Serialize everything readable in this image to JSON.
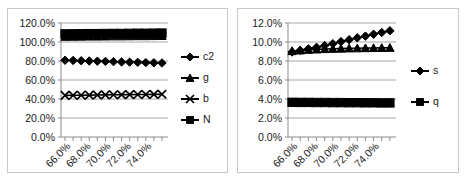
{
  "figure": {
    "panel_count": 2,
    "background_color": "#ffffff",
    "frame_color": "#c8c8c8"
  },
  "chart_data": [
    {
      "id": "left-panel",
      "type": "line",
      "title": "",
      "xlabel": "",
      "ylabel": "",
      "grid": true,
      "legend_position": "right",
      "xlim": [
        65.0,
        75.6
      ],
      "ylim": [
        0.0,
        1.2
      ],
      "ytick_labels": [
        "0.0%",
        "20.0%",
        "40.0%",
        "60.0%",
        "80.0%",
        "100.0%",
        "120.0%"
      ],
      "ytick_values": [
        0.0,
        0.2,
        0.4,
        0.6,
        0.8,
        1.0,
        1.2
      ],
      "xtick_labels": [
        "66.0%",
        "68.0%",
        "70.0%",
        "72.0%",
        "74.0%"
      ],
      "xtick_values": [
        66.0,
        68.0,
        70.0,
        72.0,
        74.0
      ],
      "x": [
        65.4,
        66.2,
        67.0,
        67.8,
        68.6,
        69.4,
        70.2,
        71.0,
        71.8,
        72.6,
        73.4,
        74.2,
        75.0
      ],
      "series": [
        {
          "name": "c2",
          "marker": "diamond",
          "values": [
            0.808,
            0.806,
            0.803,
            0.8,
            0.798,
            0.796,
            0.793,
            0.79,
            0.788,
            0.786,
            0.783,
            0.781,
            0.779
          ]
        },
        {
          "name": "g",
          "marker": "triangle",
          "values": [
            1.055,
            1.056,
            1.057,
            1.058,
            1.058,
            1.059,
            1.06,
            1.06,
            1.061,
            1.062,
            1.062,
            1.063,
            1.064
          ]
        },
        {
          "name": "b",
          "marker": "x",
          "values": [
            0.438,
            0.439,
            0.44,
            0.441,
            0.442,
            0.443,
            0.444,
            0.445,
            0.446,
            0.447,
            0.448,
            0.449,
            0.45
          ]
        },
        {
          "name": "N",
          "marker": "square",
          "values": [
            1.085,
            1.086,
            1.087,
            1.088,
            1.088,
            1.089,
            1.09,
            1.09,
            1.091,
            1.092,
            1.092,
            1.093,
            1.094
          ]
        }
      ],
      "legend": [
        {
          "label": "c2",
          "marker": "diamond"
        },
        {
          "label": "g",
          "marker": "triangle"
        },
        {
          "label": "b",
          "marker": "x"
        },
        {
          "label": "N",
          "marker": "square"
        }
      ]
    },
    {
      "id": "right-panel",
      "type": "line",
      "title": "",
      "xlabel": "",
      "ylabel": "",
      "grid": true,
      "legend_position": "right",
      "xlim": [
        65.0,
        75.6
      ],
      "ylim": [
        0.0,
        0.12
      ],
      "ytick_labels": [
        "0.0%",
        "2.0%",
        "4.0%",
        "6.0%",
        "8.0%",
        "10.0%",
        "12.0%"
      ],
      "ytick_values": [
        0.0,
        0.02,
        0.04,
        0.06,
        0.08,
        0.1,
        0.12
      ],
      "xtick_labels": [
        "66.0%",
        "68.0%",
        "70.0%",
        "72.0%",
        "74.0%"
      ],
      "xtick_values": [
        66.0,
        68.0,
        70.0,
        72.0,
        74.0
      ],
      "x": [
        65.4,
        66.2,
        67.0,
        67.8,
        68.6,
        69.4,
        70.2,
        71.0,
        71.8,
        72.6,
        73.4,
        74.2,
        75.0
      ],
      "series": [
        {
          "name": "s",
          "marker": "diamond",
          "values": [
            0.0895,
            0.0912,
            0.0928,
            0.0944,
            0.0962,
            0.0982,
            0.1004,
            0.1024,
            0.1044,
            0.1062,
            0.1082,
            0.11,
            0.1118
          ]
        },
        {
          "name": "unlabeled-triangle",
          "marker": "triangle",
          "values": [
            0.0905,
            0.0912,
            0.0918,
            0.0922,
            0.0926,
            0.0929,
            0.0931,
            0.0933,
            0.0934,
            0.0936,
            0.0937,
            0.0938,
            0.0939
          ]
        },
        {
          "name": "q",
          "marker": "square",
          "values": [
            0.0365,
            0.0364,
            0.0364,
            0.0363,
            0.0363,
            0.0362,
            0.0362,
            0.0361,
            0.0361,
            0.036,
            0.036,
            0.0359,
            0.0359
          ]
        }
      ],
      "legend": [
        {
          "label": "s",
          "marker": "diamond"
        },
        {
          "label": "q",
          "marker": "square"
        }
      ]
    }
  ]
}
